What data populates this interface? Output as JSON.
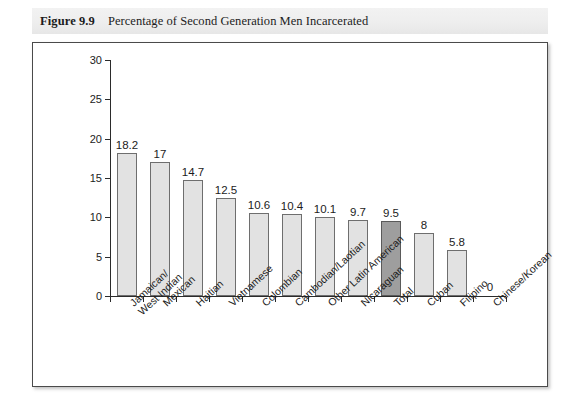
{
  "figure": {
    "label": "Figure 9.9",
    "title": "Percentage of Second Generation Men Incarcerated"
  },
  "chart_data": {
    "type": "bar",
    "title": "Percentage of Second Generation Men Incarcerated",
    "xlabel": "",
    "ylabel": "",
    "ylim": [
      0,
      30
    ],
    "yticks": [
      0,
      5,
      10,
      15,
      20,
      25,
      30
    ],
    "grid": false,
    "legend": null,
    "value_labels": true,
    "categories": [
      "Jamaican/West Indian",
      "Mexican",
      "Haitian",
      "Vietnamese",
      "Colombian",
      "Cambodian/Laotian",
      "Other Latin American",
      "Nicaraguan",
      "Total",
      "Cuban",
      "Filipino",
      "Chinese/Korean"
    ],
    "values": [
      18.2,
      17,
      14.7,
      12.5,
      10.6,
      10.4,
      10.1,
      9.7,
      9.5,
      8,
      5.8,
      0
    ],
    "value_label_text": [
      "18.2",
      "17",
      "14.7",
      "12.5",
      "10.6",
      "10.4",
      "10.1",
      "9.7",
      "9.5",
      "8",
      "5.8",
      "0"
    ],
    "highlighted_category": "Total",
    "colors": {
      "bar_fill": "#e2e2e2",
      "bar_border": "#6e6e6e",
      "highlight_fill": "#9e9e9e",
      "highlight_border": "#5a5a5a",
      "axis": "#2b2b2b",
      "text": "#1c1c1c",
      "caption_band": "#eeeeee",
      "frame_border": "#4a4a4a"
    },
    "category_label_lines": [
      [
        "Jamaican/",
        "West Indian"
      ],
      [
        "Mexican",
        ""
      ],
      [
        "Haitian",
        ""
      ],
      [
        "Vietnamese",
        ""
      ],
      [
        "Colombian",
        ""
      ],
      [
        "Cambodian/Laotian",
        ""
      ],
      [
        "Other Latin American",
        ""
      ],
      [
        "Nicaraguan",
        ""
      ],
      [
        "Total",
        ""
      ],
      [
        "Cuban",
        ""
      ],
      [
        "Filipino",
        ""
      ],
      [
        "Chinese/Korean",
        ""
      ]
    ]
  }
}
